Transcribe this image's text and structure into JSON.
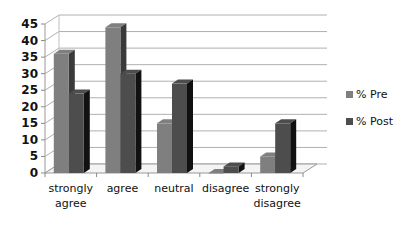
{
  "chart_data": {
    "type": "bar",
    "style": "3d-clustered-column",
    "title": "",
    "xlabel": "",
    "ylabel": "",
    "categories": [
      "strongly agree",
      "agree",
      "neutral",
      "disagree",
      "strongly disagree"
    ],
    "category_lines": [
      [
        "strongly",
        "agree"
      ],
      [
        "agree"
      ],
      [
        "neutral"
      ],
      [
        "disagree"
      ],
      [
        "strongly",
        "disagree"
      ]
    ],
    "series": [
      {
        "name": "% Pre",
        "values": [
          36,
          44,
          15,
          0,
          5
        ],
        "color": "#7f7f7f"
      },
      {
        "name": "% Post",
        "values": [
          24,
          30,
          27,
          2,
          15
        ],
        "color": "#4d4d4d"
      }
    ],
    "ylim": [
      0,
      45
    ],
    "yticks": [
      0,
      5,
      10,
      15,
      20,
      25,
      30,
      35,
      40,
      45
    ],
    "grid": true,
    "legend_position": "right"
  },
  "legend": {
    "items": [
      {
        "label": "% Pre",
        "color": "#7f7f7f"
      },
      {
        "label": "% Post",
        "color": "#4d4d4d"
      }
    ]
  }
}
